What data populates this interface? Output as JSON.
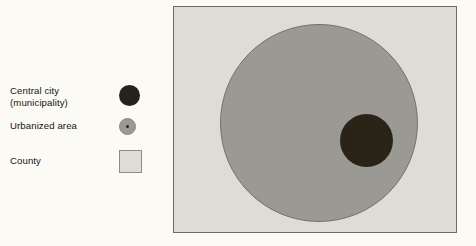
{
  "figure": {
    "type": "schematic-diagram"
  },
  "legend": {
    "items": [
      {
        "label": "Central city\n(municipality)",
        "symbol": "filled-circle",
        "color": "#272117"
      },
      {
        "label": "Urbanized area",
        "symbol": "filled-circle-with-center-dot",
        "color": "#9b9993",
        "dot_color": "#2b2620"
      },
      {
        "label": "County",
        "symbol": "filled-square",
        "color": "#dedcd4",
        "border_color": "#8d8b84"
      }
    ]
  },
  "map": {
    "county": {
      "shape": "rectangle",
      "fill": "#dedcd4",
      "border": "#6d6b63"
    },
    "urbanized_area": {
      "shape": "circle",
      "fill": "#9b9993",
      "border": "#73716a"
    },
    "central_city": {
      "shape": "circle",
      "fill": "#292318"
    }
  }
}
